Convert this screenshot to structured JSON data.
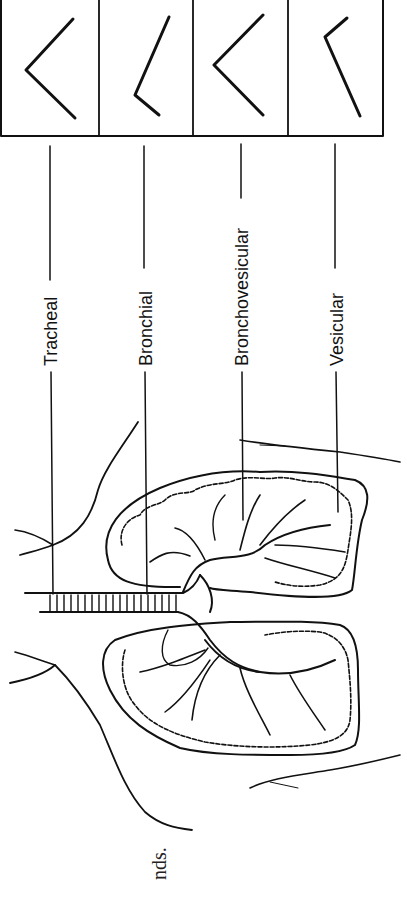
{
  "diagram": {
    "orientation": "rotated-90-ccw",
    "waveform_boxes": [
      {
        "index": 0,
        "sound": "Tracheal",
        "shape": "symmetric inspiration/expiration angle"
      },
      {
        "index": 1,
        "sound": "Bronchial",
        "shape": "short inspiration, long expiration"
      },
      {
        "index": 2,
        "sound": "Bronchovesicular",
        "shape": "equal inspiration and expiration"
      },
      {
        "index": 3,
        "sound": "Vesicular",
        "shape": "long inspiration, short expiration"
      }
    ],
    "labels": [
      {
        "text": "Tracheal"
      },
      {
        "text": "Bronchial"
      },
      {
        "text": "Bronchovesicular"
      },
      {
        "text": "Vesicular"
      }
    ],
    "caption_fragment": "nds.",
    "colors": {
      "line": "#111111",
      "background": "#ffffff"
    }
  }
}
